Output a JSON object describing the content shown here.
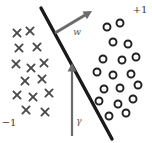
{
  "figure": {
    "background_color": "#ffffff",
    "width": 152,
    "height": 143
  },
  "labels": {
    "positive_class": "+1",
    "negative_class": "−1",
    "weight_vector": "w",
    "margin": "γ"
  },
  "colors": {
    "boundary": "#1a1a1a",
    "marker_cross": "#4a4a4a",
    "marker_circle": "#1f1f1f",
    "arrow": "#6b6b6b",
    "text": "#3a3a3a",
    "background": "#ffffff"
  },
  "chart_data": {
    "type": "scatter",
    "xlabel": "",
    "ylabel": "",
    "xlim": [
      0,
      152
    ],
    "ylim": [
      0,
      143
    ],
    "grid": false,
    "legend_position": "none",
    "annotations": [
      {
        "name": "positive-class-label",
        "text": "+1",
        "x": 140,
        "y": 13
      },
      {
        "name": "negative-class-label",
        "text": "−1",
        "x": 9,
        "y": 126
      },
      {
        "name": "weight-vector-label",
        "text": "w",
        "x": 77,
        "y": 35
      },
      {
        "name": "margin-label",
        "text": "γ",
        "x": 79,
        "y": 124
      }
    ],
    "decision_boundary": {
      "name": "decision-boundary",
      "x1": 41,
      "y1": 8,
      "x2": 112,
      "y2": 139,
      "stroke_width": 3.4
    },
    "vectors": [
      {
        "name": "weight-vector-arrow",
        "label": "w",
        "x1": 55,
        "y1": 33,
        "x2": 92,
        "y2": 11,
        "stroke_width": 3.0
      },
      {
        "name": "margin-arrow",
        "label": "γ",
        "x1": 72,
        "y1": 136,
        "x2": 72,
        "y2": 63,
        "stroke_width": 2.2
      }
    ],
    "series": [
      {
        "name": "negative-class",
        "marker": "cross",
        "label": "−1",
        "count": 18,
        "points": [
          [
            17,
            33
          ],
          [
            30,
            31
          ],
          [
            19,
            48
          ],
          [
            37,
            47
          ],
          [
            16,
            64
          ],
          [
            31,
            68
          ],
          [
            44,
            63
          ],
          [
            25,
            81
          ],
          [
            42,
            79
          ],
          [
            17,
            95
          ],
          [
            33,
            97
          ],
          [
            49,
            93
          ],
          [
            26,
            110
          ],
          [
            45,
            112
          ]
        ]
      },
      {
        "name": "positive-class",
        "marker": "circle",
        "label": "+1",
        "count": 18,
        "points": [
          [
            107,
            27
          ],
          [
            120,
            23
          ],
          [
            113,
            42
          ],
          [
            128,
            44
          ],
          [
            103,
            59
          ],
          [
            122,
            60
          ],
          [
            136,
            57
          ],
          [
            97,
            72
          ],
          [
            113,
            75
          ],
          [
            131,
            74
          ],
          [
            104,
            89
          ],
          [
            120,
            88
          ],
          [
            138,
            85
          ],
          [
            99,
            101
          ],
          [
            118,
            104
          ],
          [
            133,
            99
          ],
          [
            109,
            116
          ],
          [
            126,
            113
          ]
        ]
      }
    ]
  }
}
